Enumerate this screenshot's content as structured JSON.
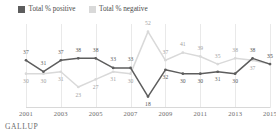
{
  "legend": {
    "items": [
      {
        "label": "Total % positive",
        "color": "#5d5d5d",
        "key": "positive"
      },
      {
        "label": "Total % negative",
        "color": "#d9d9d9",
        "key": "negative"
      }
    ]
  },
  "footer": {
    "source": "GALLUP"
  },
  "chart_data": {
    "type": "line",
    "title": "",
    "subtitle": "",
    "xlabel": "",
    "ylabel": "",
    "grid": "vertical",
    "legend_position": "top-left",
    "ylim": [
      12,
      56
    ],
    "xlim": [
      2001,
      2015
    ],
    "x": [
      2001,
      2002,
      2003,
      2004,
      2005,
      2006,
      2007,
      2008,
      2009,
      2010,
      2011,
      2012,
      2013,
      2014,
      2015
    ],
    "xticks": [
      "2001",
      "2003",
      "2005",
      "2007",
      "2009",
      "2011",
      "2013",
      "2015"
    ],
    "xtick_values": [
      2001,
      2003,
      2005,
      2007,
      2009,
      2011,
      2013,
      2015
    ],
    "series": [
      {
        "name": "Total % positive",
        "color": "#5d5d5d",
        "values": [
          37,
          31,
          37,
          38,
          38,
          33,
          33,
          18,
          32,
          30,
          30,
          31,
          30,
          38,
          35
        ],
        "labels": [
          "37",
          "31",
          "37",
          "38",
          "38",
          "33",
          "33",
          "18",
          "32",
          "30",
          "30",
          "31",
          "30",
          "38",
          "35"
        ]
      },
      {
        "name": "Total % negative",
        "color": "#d9d9d9",
        "values": [
          30,
          30,
          31,
          23,
          27,
          31,
          30,
          52,
          37,
          41,
          39,
          35,
          38,
          37,
          35
        ],
        "labels": [
          "30",
          "30",
          "31",
          "23",
          "27",
          "31",
          "30",
          "52",
          "37",
          "41",
          "39",
          "35",
          "38",
          "37",
          "35"
        ]
      }
    ],
    "extra_labels": {
      "positive_tail": [
        "35",
        "38",
        "37",
        "35"
      ],
      "negative_tail": [
        "31",
        "30",
        "25",
        "32"
      ]
    }
  }
}
